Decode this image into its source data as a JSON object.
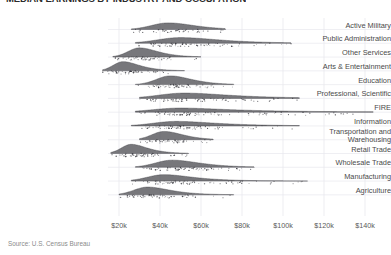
{
  "header": {
    "title": "MEDIAN EARNINGS BY INDUSTRY AND OCCUPATION",
    "title_clipped": true
  },
  "source": {
    "note": "Source: U.S. Census Bureau"
  },
  "axis": {
    "x_ticks": [
      "$20k",
      "$40k",
      "$60k",
      "$80k",
      "$100k",
      "$120k",
      "$140k"
    ],
    "x_tick_values": [
      20000,
      40000,
      60000,
      80000,
      100000,
      120000,
      140000
    ],
    "y_labels": [
      "Active Military",
      "Public Administration",
      "Other Services",
      "Arts & Entertainment",
      "Education",
      "Professional, Scientific",
      "FIRE",
      "Information",
      "Transportation and\nWarehousing",
      "Retail Trade",
      "Wholesale Trade",
      "Manufacturing",
      "Agriculture"
    ]
  },
  "colors": {
    "density_fill": "#55555a",
    "density_line": "#3a3a40",
    "point": "#2e2e34",
    "grid": "#e8e8ee",
    "text": "#4a4a4a",
    "muted_text": "#8a8a8a",
    "background": "#ffffff"
  },
  "chart_data": {
    "type": "area",
    "subtype": "ridgeline-density-with-jittered-points",
    "title": "MEDIAN EARNINGS BY INDUSTRY AND OCCUPATION",
    "xlabel": "",
    "ylabel": "",
    "xlim": [
      8000,
      150000
    ],
    "grid": true,
    "grid_axis": "both",
    "legend": "none",
    "x_unit": "USD",
    "categories": [
      "Active Military",
      "Public Administration",
      "Other Services",
      "Arts & Entertainment",
      "Education",
      "Professional, Scientific",
      "FIRE",
      "Information",
      "Transportation and Warehousing",
      "Retail Trade",
      "Wholesale Trade",
      "Manufacturing",
      "Agriculture"
    ],
    "series": [
      {
        "name": "Active Military",
        "peak": 44000,
        "spread": 11000,
        "min": 26000,
        "max": 72000,
        "height": 0.72,
        "skew": 0.55,
        "n_points": 42
      },
      {
        "name": "Public Administration",
        "peak": 50000,
        "spread": 15000,
        "min": 28000,
        "max": 104000,
        "height": 0.62,
        "skew": 0.9,
        "n_points": 70
      },
      {
        "name": "Other Services",
        "peak": 30000,
        "spread": 7500,
        "min": 17000,
        "max": 60000,
        "height": 1.0,
        "skew": 0.7,
        "n_points": 55
      },
      {
        "name": "Arts & Entertainment",
        "peak": 22000,
        "spread": 6500,
        "min": 12000,
        "max": 52000,
        "height": 1.0,
        "skew": 0.8,
        "n_points": 50
      },
      {
        "name": "Education",
        "peak": 45000,
        "spread": 9000,
        "min": 28000,
        "max": 76000,
        "height": 0.95,
        "skew": 0.6,
        "n_points": 64
      },
      {
        "name": "Professional, Scientific",
        "peak": 52000,
        "spread": 17000,
        "min": 30000,
        "max": 108000,
        "height": 0.58,
        "skew": 1.0,
        "n_points": 78
      },
      {
        "name": "FIRE",
        "peak": 50000,
        "spread": 18000,
        "min": 28000,
        "max": 144000,
        "height": 0.45,
        "skew": 1.3,
        "n_points": 92
      },
      {
        "name": "Information",
        "peak": 48000,
        "spread": 15000,
        "min": 26000,
        "max": 108000,
        "height": 0.5,
        "skew": 1.0,
        "n_points": 72
      },
      {
        "name": "Transportation and Warehousing",
        "peak": 42000,
        "spread": 8000,
        "min": 30000,
        "max": 66000,
        "height": 0.9,
        "skew": 0.55,
        "n_points": 48
      },
      {
        "name": "Retail Trade",
        "peak": 26000,
        "spread": 6500,
        "min": 16000,
        "max": 54000,
        "height": 1.0,
        "skew": 0.75,
        "n_points": 58
      },
      {
        "name": "Wholesale Trade",
        "peak": 46000,
        "spread": 11000,
        "min": 28000,
        "max": 86000,
        "height": 0.78,
        "skew": 0.75,
        "n_points": 66
      },
      {
        "name": "Manufacturing",
        "peak": 42000,
        "spread": 11000,
        "min": 26000,
        "max": 112000,
        "height": 0.7,
        "skew": 0.95,
        "n_points": 74
      },
      {
        "name": "Agriculture",
        "peak": 34000,
        "spread": 9000,
        "min": 20000,
        "max": 76000,
        "height": 0.85,
        "skew": 0.8,
        "n_points": 60
      }
    ]
  }
}
